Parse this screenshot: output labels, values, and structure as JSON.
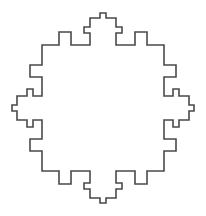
{
  "diagram": {
    "type": "fractal-outline",
    "stroke_color": "#4a4a4a",
    "background_color": "#ffffff",
    "stroke_width": 1.6,
    "center": [
      103,
      108
    ],
    "quadrant_offsets": [
      [
        -3,
        -95
      ],
      [
        3,
        -95
      ],
      [
        3,
        -90
      ],
      [
        13,
        -90
      ],
      [
        13,
        -81
      ],
      [
        19,
        -81
      ],
      [
        19,
        -75
      ],
      [
        13,
        -75
      ],
      [
        13,
        -63
      ],
      [
        32,
        -63
      ],
      [
        32,
        -76
      ],
      [
        44,
        -76
      ],
      [
        44,
        -63
      ],
      [
        61,
        -63
      ],
      [
        61,
        -43
      ],
      [
        73,
        -43
      ],
      [
        73,
        -31
      ],
      [
        61,
        -31
      ],
      [
        61,
        -12
      ],
      [
        70,
        -12
      ],
      [
        70,
        -19
      ],
      [
        76,
        -19
      ],
      [
        76,
        -12
      ],
      [
        86,
        -12
      ],
      [
        86,
        -3
      ],
      [
        91,
        -3
      ],
      [
        91,
        0
      ]
    ]
  }
}
